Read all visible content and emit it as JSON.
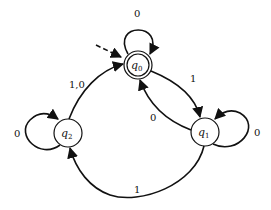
{
  "diagram": {
    "type": "finite-automaton",
    "start_state": "q0",
    "accept_states": [
      "q0"
    ],
    "states": [
      {
        "id": "q0",
        "name": "q",
        "subscript": "0",
        "accepting": true,
        "start": true
      },
      {
        "id": "q1",
        "name": "q",
        "subscript": "1",
        "accepting": false,
        "start": false
      },
      {
        "id": "q2",
        "name": "q",
        "subscript": "2",
        "accepting": false,
        "start": false
      }
    ],
    "transitions": [
      {
        "id": "t-q0-q0",
        "from": "q0",
        "to": "q0",
        "label": "0"
      },
      {
        "id": "t-q0-q1",
        "from": "q0",
        "to": "q1",
        "label": "1"
      },
      {
        "id": "t-q1-q0",
        "from": "q1",
        "to": "q0",
        "label": "0"
      },
      {
        "id": "t-q1-q1",
        "from": "q1",
        "to": "q1",
        "label": "0"
      },
      {
        "id": "t-q1-q2",
        "from": "q1",
        "to": "q2",
        "label": "1"
      },
      {
        "id": "t-q2-q2",
        "from": "q2",
        "to": "q2",
        "label": "0"
      },
      {
        "id": "t-q2-q0",
        "from": "q2",
        "to": "q0",
        "label": "1,0"
      }
    ],
    "colors": {
      "stroke": "#111111",
      "fill": "#ffffff"
    }
  }
}
